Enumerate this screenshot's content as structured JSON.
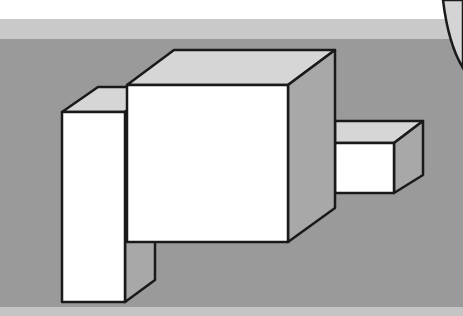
{
  "scene": {
    "description": "Isometric line drawing of three rectangular blocks on a gray background",
    "colors": {
      "top_band": "#ffffff",
      "light_band": "#c9c9c9",
      "background": "#9a9a9a",
      "bottom_band": "#c4c4c4",
      "front_face": "#ffffff",
      "top_face": "#d6d6d6",
      "side_face": "#a8a8a8",
      "outline": "#1a1a1a",
      "corner_shape": "#d4d4d4"
    },
    "blocks": [
      {
        "name": "tall-left-block"
      },
      {
        "name": "large-center-cube"
      },
      {
        "name": "small-right-block"
      }
    ]
  }
}
